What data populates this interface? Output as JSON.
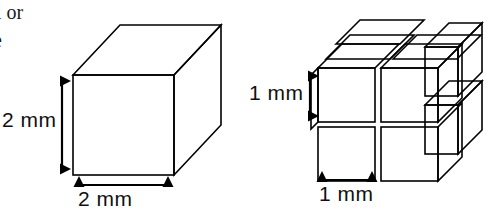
{
  "figure": {
    "kind": "geometry-illustration",
    "background_color": "#ffffff",
    "line_color": "#000000"
  },
  "body_text": {
    "line_1": "l or",
    "line_2": "e"
  },
  "left_figure": {
    "name": "single-large-cube",
    "height_label": "2 mm",
    "width_label": "2 mm",
    "edge_length_mm": 2,
    "subcube_count": 1,
    "face_colors": {
      "front_light": "#f4f4f4",
      "front_dark": "#9c9c9c",
      "top_light": "#d0d0d0",
      "top_dark": "#8a8a8a",
      "side_light": "#cacaca",
      "side_dark": "#8f8f8f"
    }
  },
  "right_figure": {
    "name": "divided-cube-assembly",
    "height_label": "1 mm",
    "width_label": "1 mm",
    "edge_length_mm": 1,
    "subcube_count": 8,
    "grid": {
      "columns": 2,
      "rows": 2,
      "layers": 2
    },
    "face_colors": {
      "front_light": "#f0f0f0",
      "front_dark": "#989898",
      "top_light": "#cfcfcf",
      "top_dark": "#8c8c8c",
      "side_light": "#c6c6c6",
      "side_dark": "#8d8d8d"
    }
  },
  "annotations": {
    "left_height_arrow": "vertical-double-arrow",
    "left_width_arrow": "horizontal-double-arrow",
    "right_height_arrow": "vertical-double-arrow",
    "right_width_arrow": "horizontal-double-arrow"
  }
}
